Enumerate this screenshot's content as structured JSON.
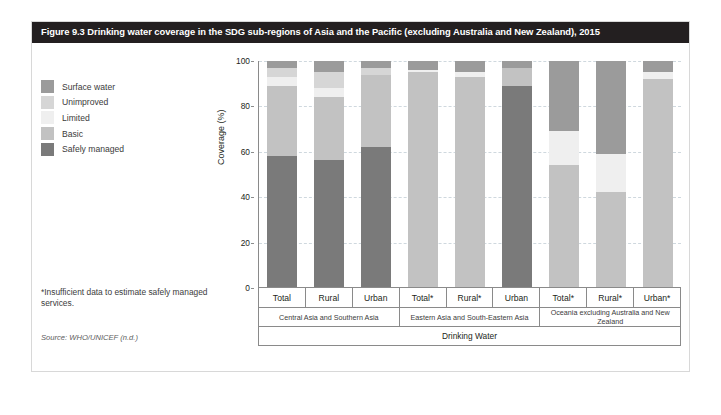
{
  "figure": {
    "title": "Figure 9.3  Drinking water coverage in the SDG sub-regions of Asia and the Pacific (excluding Australia and New Zealand), 2015",
    "footnote": "*Insufficient data to estimate safely managed services.",
    "source": "Source: WHO/UNICEF (n.d.)"
  },
  "legend": {
    "items": [
      {
        "label": "Surface water",
        "color": "#9b9b9b"
      },
      {
        "label": "Unimproved",
        "color": "#d6d6d6"
      },
      {
        "label": "Limited",
        "color": "#efefef"
      },
      {
        "label": "Basic",
        "color": "#c2c2c2"
      },
      {
        "label": "Safely managed",
        "color": "#7a7a7a"
      }
    ]
  },
  "chart_data": {
    "type": "bar",
    "subtype": "stacked-bar",
    "title": "Drinking water coverage in the SDG sub-regions of Asia and the Pacific (excluding Australia and New Zealand), 2015",
    "xlabel": "Drinking Water",
    "ylabel": "Coverage (%)",
    "ylim": [
      0,
      100
    ],
    "yticks": [
      0,
      20,
      40,
      60,
      80,
      100
    ],
    "grid": true,
    "legend_position": "left",
    "stack_order_bottom_to_top": [
      "Safely managed",
      "Basic",
      "Limited",
      "Unimproved",
      "Surface water"
    ],
    "categories": [
      "Total",
      "Rural",
      "Urban",
      "Total*",
      "Rural*",
      "Urban",
      "Total*",
      "Rural*",
      "Urban*"
    ],
    "groups": [
      {
        "name": "Central Asia and Southern Asia",
        "categories": [
          "Total",
          "Rural",
          "Urban"
        ]
      },
      {
        "name": "Eastern Asia and South-Eastern Asia",
        "categories": [
          "Total*",
          "Rural*",
          "Urban"
        ]
      },
      {
        "name": "Oceania excluding Australia and New Zealand",
        "categories": [
          "Total*",
          "Rural*",
          "Urban*"
        ]
      }
    ],
    "axis_bottom_label": "Drinking Water",
    "series": [
      {
        "name": "Safely managed",
        "color": "#7a7a7a",
        "values": [
          58,
          56,
          62,
          0,
          0,
          89,
          0,
          0,
          0
        ]
      },
      {
        "name": "Basic",
        "color": "#c2c2c2",
        "values": [
          31,
          28,
          32,
          95,
          93,
          8,
          54,
          42,
          92
        ]
      },
      {
        "name": "Limited",
        "color": "#efefef",
        "values": [
          4,
          4,
          0,
          1,
          2,
          0,
          15,
          17,
          3
        ]
      },
      {
        "name": "Unimproved",
        "color": "#d6d6d6",
        "values": [
          4,
          7,
          3,
          0,
          0,
          0,
          0,
          0,
          0
        ]
      },
      {
        "name": "Surface water",
        "color": "#9b9b9b",
        "values": [
          3,
          5,
          3,
          4,
          5,
          3,
          31,
          41,
          5
        ]
      }
    ],
    "bars": [
      {
        "group": "Central Asia and Southern Asia",
        "category": "Total",
        "segments": [
          {
            "name": "Safely managed",
            "value": 58,
            "color": "#7a7a7a"
          },
          {
            "name": "Basic",
            "value": 31,
            "color": "#c2c2c2"
          },
          {
            "name": "Limited",
            "value": 4,
            "color": "#efefef"
          },
          {
            "name": "Unimproved",
            "value": 4,
            "color": "#d6d6d6"
          },
          {
            "name": "Surface water",
            "value": 3,
            "color": "#9b9b9b"
          }
        ]
      },
      {
        "group": "Central Asia and Southern Asia",
        "category": "Rural",
        "segments": [
          {
            "name": "Safely managed",
            "value": 56,
            "color": "#7a7a7a"
          },
          {
            "name": "Basic",
            "value": 28,
            "color": "#c2c2c2"
          },
          {
            "name": "Limited",
            "value": 4,
            "color": "#efefef"
          },
          {
            "name": "Unimproved",
            "value": 7,
            "color": "#d6d6d6"
          },
          {
            "name": "Surface water",
            "value": 5,
            "color": "#9b9b9b"
          }
        ]
      },
      {
        "group": "Central Asia and Southern Asia",
        "category": "Urban",
        "segments": [
          {
            "name": "Safely managed",
            "value": 62,
            "color": "#7a7a7a"
          },
          {
            "name": "Basic",
            "value": 32,
            "color": "#c2c2c2"
          },
          {
            "name": "Limited",
            "value": 0,
            "color": "#efefef"
          },
          {
            "name": "Unimproved",
            "value": 3,
            "color": "#d6d6d6"
          },
          {
            "name": "Surface water",
            "value": 3,
            "color": "#9b9b9b"
          }
        ]
      },
      {
        "group": "Eastern Asia and South-Eastern Asia",
        "category": "Total*",
        "segments": [
          {
            "name": "Safely managed",
            "value": 0,
            "color": "#7a7a7a"
          },
          {
            "name": "Basic",
            "value": 95,
            "color": "#c2c2c2"
          },
          {
            "name": "Limited",
            "value": 1,
            "color": "#efefef"
          },
          {
            "name": "Unimproved",
            "value": 0,
            "color": "#d6d6d6"
          },
          {
            "name": "Surface water",
            "value": 4,
            "color": "#9b9b9b"
          }
        ]
      },
      {
        "group": "Eastern Asia and South-Eastern Asia",
        "category": "Rural*",
        "segments": [
          {
            "name": "Safely managed",
            "value": 0,
            "color": "#7a7a7a"
          },
          {
            "name": "Basic",
            "value": 93,
            "color": "#c2c2c2"
          },
          {
            "name": "Limited",
            "value": 2,
            "color": "#efefef"
          },
          {
            "name": "Unimproved",
            "value": 0,
            "color": "#d6d6d6"
          },
          {
            "name": "Surface water",
            "value": 5,
            "color": "#9b9b9b"
          }
        ]
      },
      {
        "group": "Eastern Asia and South-Eastern Asia",
        "category": "Urban",
        "segments": [
          {
            "name": "Safely managed",
            "value": 89,
            "color": "#7a7a7a"
          },
          {
            "name": "Basic",
            "value": 8,
            "color": "#c2c2c2"
          },
          {
            "name": "Limited",
            "value": 0,
            "color": "#efefef"
          },
          {
            "name": "Unimproved",
            "value": 0,
            "color": "#d6d6d6"
          },
          {
            "name": "Surface water",
            "value": 3,
            "color": "#9b9b9b"
          }
        ]
      },
      {
        "group": "Oceania excluding Australia and New Zealand",
        "category": "Total*",
        "segments": [
          {
            "name": "Safely managed",
            "value": 0,
            "color": "#7a7a7a"
          },
          {
            "name": "Basic",
            "value": 54,
            "color": "#c2c2c2"
          },
          {
            "name": "Limited",
            "value": 15,
            "color": "#efefef"
          },
          {
            "name": "Unimproved",
            "value": 0,
            "color": "#d6d6d6"
          },
          {
            "name": "Surface water",
            "value": 31,
            "color": "#9b9b9b"
          }
        ]
      },
      {
        "group": "Oceania excluding Australia and New Zealand",
        "category": "Rural*",
        "segments": [
          {
            "name": "Safely managed",
            "value": 0,
            "color": "#7a7a7a"
          },
          {
            "name": "Basic",
            "value": 42,
            "color": "#c2c2c2"
          },
          {
            "name": "Limited",
            "value": 17,
            "color": "#efefef"
          },
          {
            "name": "Unimproved",
            "value": 0,
            "color": "#d6d6d6"
          },
          {
            "name": "Surface water",
            "value": 41,
            "color": "#9b9b9b"
          }
        ]
      },
      {
        "group": "Oceania excluding Australia and New Zealand",
        "category": "Urban*",
        "segments": [
          {
            "name": "Safely managed",
            "value": 0,
            "color": "#7a7a7a"
          },
          {
            "name": "Basic",
            "value": 92,
            "color": "#c2c2c2"
          },
          {
            "name": "Limited",
            "value": 3,
            "color": "#efefef"
          },
          {
            "name": "Unimproved",
            "value": 0,
            "color": "#d6d6d6"
          },
          {
            "name": "Surface water",
            "value": 5,
            "color": "#9b9b9b"
          }
        ]
      }
    ]
  }
}
